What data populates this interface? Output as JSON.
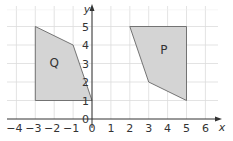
{
  "diagram": {
    "type": "coordinate-grid",
    "x_axis": {
      "label": "x",
      "min": -4,
      "max": 6,
      "ticks": [
        "−4",
        "−3",
        "−2",
        "−1",
        "0",
        "1",
        "2",
        "3",
        "4",
        "5",
        "6"
      ]
    },
    "y_axis": {
      "label": "y",
      "min": 0,
      "max": 5,
      "ticks": [
        "0",
        "1",
        "2",
        "3",
        "4",
        "5"
      ]
    },
    "colors": {
      "grid": "#dcdcdc",
      "axis": "#333333",
      "fill": "#d4d4d4",
      "stroke": "#666666"
    },
    "shapes": [
      {
        "name": "Q",
        "label": "Q",
        "vertices": [
          [
            -3,
            5
          ],
          [
            -1,
            4
          ],
          [
            0,
            1
          ],
          [
            -3,
            1
          ]
        ],
        "label_pos": [
          -2,
          2.8
        ]
      },
      {
        "name": "P",
        "label": "P",
        "vertices": [
          [
            2,
            5
          ],
          [
            5,
            5
          ],
          [
            5,
            1
          ],
          [
            3,
            2
          ]
        ],
        "label_pos": [
          3.8,
          3.5
        ]
      }
    ]
  }
}
